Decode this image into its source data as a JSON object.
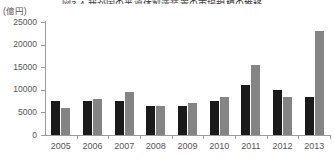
{
  "figure": {
    "title_clipped": "図3-4 我が国の半導体製造装置の市場規模の推移",
    "unit_label": "(億円)"
  },
  "chart_data": {
    "type": "bar",
    "title": "図3-4 我が国の半導体製造装置の市場規模の推移",
    "xlabel": "",
    "ylabel": "(億円)",
    "ylim": [
      0,
      25000
    ],
    "yticks": [
      0,
      5000,
      10000,
      15000,
      20000,
      25000
    ],
    "ytick_labels": [
      "0",
      "5000",
      "10000",
      "15000",
      "20000",
      "25000"
    ],
    "grid": false,
    "legend_position": "none",
    "categories": [
      "2005",
      "2006",
      "2007",
      "2008",
      "2009",
      "2010",
      "2011",
      "2012",
      "2013"
    ],
    "series": [
      {
        "name": "series-black",
        "color": "#1a1a1a",
        "values": [
          7500,
          7500,
          7500,
          6500,
          6500,
          7500,
          11000,
          10000,
          8500
        ]
      },
      {
        "name": "series-gray",
        "color": "#848484",
        "values": [
          6000,
          8000,
          9500,
          6500,
          7000,
          8500,
          15500,
          8500,
          23000
        ]
      }
    ]
  }
}
